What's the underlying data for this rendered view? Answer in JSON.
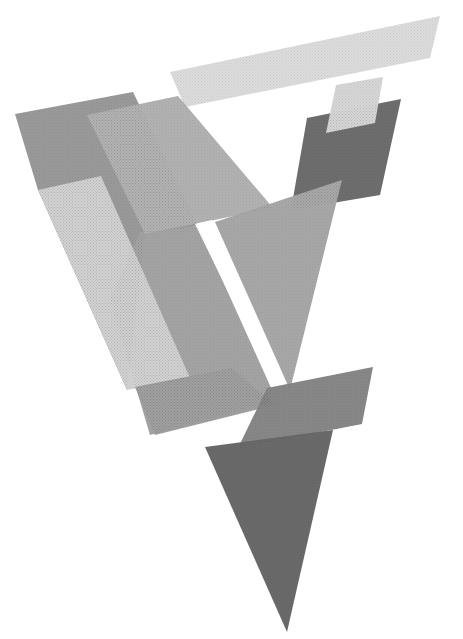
{
  "artwork": {
    "width": 463,
    "height": 639,
    "background": "#ffffff",
    "shapes": [
      {
        "name": "left-dark-slab",
        "fill": "#9a9a9a",
        "points": "15,114 133,92 198,226 145,234 127,390 38,190"
      },
      {
        "name": "center-large-parallelogram",
        "fill": "#a4a4a4",
        "points": "140,232 198,226 272,390 270,402 150,435 110,300"
      },
      {
        "name": "top-light-bar",
        "fill": "#dcdcdc",
        "points": "170,72 440,16 430,58 185,107"
      },
      {
        "name": "center-medium-panel",
        "fill": "#b2b2b2",
        "points": "87,115 178,96 273,208 145,234"
      },
      {
        "name": "right-dark-panel",
        "fill": "#6e6e6e",
        "points": "307,118 401,99 380,195 291,210"
      },
      {
        "name": "small-light-panel",
        "fill": "#d6d6d6",
        "points": "336,85 383,77 375,123 326,133"
      },
      {
        "name": "light-tall-slab",
        "fill": "#d2d2d2",
        "points": "38,190 101,176 190,378 127,390"
      },
      {
        "name": "lower-left-parallelogram",
        "fill": "#a0a0a0",
        "points": "135,387 232,368 275,405 155,435"
      },
      {
        "name": "white-gap-strip",
        "fill": "#ffffff",
        "points": "195,224 212,220 290,385 276,390"
      },
      {
        "name": "right-triangle",
        "fill": "#a8a8a8",
        "points": "215,222 342,180 290,390"
      },
      {
        "name": "lower-dark-parallelogram",
        "fill": "#888888",
        "points": "267,388 373,367 362,424 238,448"
      },
      {
        "name": "bottom-dark-triangle",
        "fill": "#6a6a6a",
        "points": "205,447 333,430 287,632"
      }
    ]
  }
}
